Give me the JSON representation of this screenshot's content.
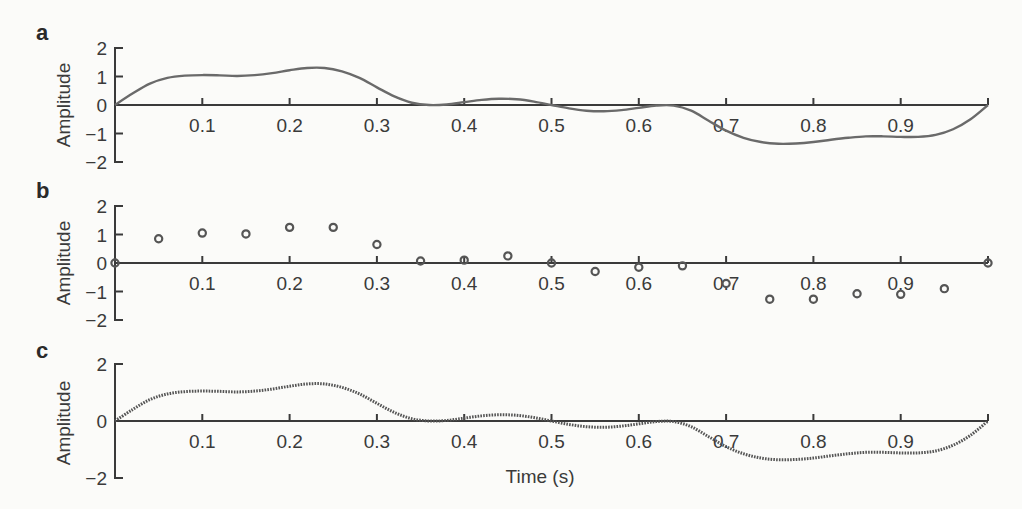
{
  "chart_data": [
    {
      "panel": "a",
      "type": "line",
      "title": "",
      "xlabel": "",
      "ylabel": "Amplitude",
      "xlim": [
        0,
        1.0
      ],
      "ylim": [
        -2,
        2
      ],
      "xticks": [
        "0.1",
        "0.2",
        "0.3",
        "0.4",
        "0.5",
        "0.6",
        "0.7",
        "0.8",
        "0.9"
      ],
      "yticks": [
        "2",
        "1",
        "0",
        "−1",
        "−2"
      ],
      "x": [
        0,
        0.02,
        0.04,
        0.06,
        0.08,
        0.1,
        0.12,
        0.14,
        0.16,
        0.18,
        0.2,
        0.22,
        0.24,
        0.26,
        0.28,
        0.3,
        0.32,
        0.34,
        0.36,
        0.38,
        0.4,
        0.42,
        0.44,
        0.46,
        0.48,
        0.5,
        0.52,
        0.54,
        0.56,
        0.58,
        0.6,
        0.62,
        0.64,
        0.66,
        0.68,
        0.7,
        0.72,
        0.74,
        0.76,
        0.78,
        0.8,
        0.82,
        0.84,
        0.86,
        0.88,
        0.9,
        0.92,
        0.94,
        0.96,
        0.98,
        1.0
      ],
      "y": [
        0,
        0.4,
        0.75,
        0.95,
        1.03,
        1.05,
        1.04,
        1.02,
        1.05,
        1.12,
        1.22,
        1.3,
        1.3,
        1.18,
        0.95,
        0.62,
        0.3,
        0.08,
        0.0,
        0.02,
        0.1,
        0.18,
        0.22,
        0.2,
        0.12,
        0.0,
        -0.12,
        -0.2,
        -0.22,
        -0.18,
        -0.1,
        -0.02,
        -0.02,
        -0.2,
        -0.55,
        -0.9,
        -1.15,
        -1.3,
        -1.36,
        -1.35,
        -1.3,
        -1.22,
        -1.15,
        -1.1,
        -1.1,
        -1.12,
        -1.12,
        -1.05,
        -0.85,
        -0.5,
        0
      ]
    },
    {
      "panel": "b",
      "type": "scatter",
      "title": "",
      "xlabel": "",
      "ylabel": "Amplitude",
      "xlim": [
        0,
        1.0
      ],
      "ylim": [
        -2,
        2
      ],
      "xticks": [
        "0.1",
        "0.2",
        "0.3",
        "0.4",
        "0.5",
        "0.6",
        "0.7",
        "0.8",
        "0.9"
      ],
      "yticks": [
        "2",
        "1",
        "0",
        "−1",
        "−2"
      ],
      "x": [
        0,
        0.05,
        0.1,
        0.15,
        0.2,
        0.25,
        0.3,
        0.35,
        0.4,
        0.45,
        0.5,
        0.55,
        0.6,
        0.65,
        0.7,
        0.75,
        0.8,
        0.85,
        0.9,
        0.95,
        1.0
      ],
      "y": [
        0,
        0.85,
        1.05,
        1.02,
        1.25,
        1.25,
        0.65,
        0.07,
        0.1,
        0.25,
        0.0,
        -0.3,
        -0.15,
        -0.1,
        -0.72,
        -1.27,
        -1.27,
        -1.08,
        -1.1,
        -0.9,
        0
      ]
    },
    {
      "panel": "c",
      "type": "line",
      "title": "",
      "xlabel": "Time (s)",
      "ylabel": "Amplitude",
      "xlim": [
        0,
        1.0
      ],
      "ylim": [
        -2,
        2
      ],
      "xticks": [
        "0.1",
        "0.2",
        "0.3",
        "0.4",
        "0.5",
        "0.6",
        "0.7",
        "0.8",
        "0.9"
      ],
      "yticks": [
        "2",
        "0",
        "−2"
      ],
      "x": [
        0,
        0.02,
        0.04,
        0.06,
        0.08,
        0.1,
        0.12,
        0.14,
        0.16,
        0.18,
        0.2,
        0.22,
        0.24,
        0.26,
        0.28,
        0.3,
        0.32,
        0.34,
        0.36,
        0.38,
        0.4,
        0.42,
        0.44,
        0.46,
        0.48,
        0.5,
        0.52,
        0.54,
        0.56,
        0.58,
        0.6,
        0.62,
        0.64,
        0.66,
        0.68,
        0.7,
        0.72,
        0.74,
        0.76,
        0.78,
        0.8,
        0.82,
        0.84,
        0.86,
        0.88,
        0.9,
        0.92,
        0.94,
        0.96,
        0.98,
        1.0
      ],
      "y": [
        0,
        0.4,
        0.75,
        0.95,
        1.03,
        1.05,
        1.04,
        1.02,
        1.05,
        1.12,
        1.22,
        1.3,
        1.3,
        1.18,
        0.95,
        0.62,
        0.3,
        0.08,
        0.0,
        0.02,
        0.1,
        0.18,
        0.22,
        0.2,
        0.12,
        0.0,
        -0.12,
        -0.2,
        -0.22,
        -0.18,
        -0.1,
        -0.02,
        -0.02,
        -0.2,
        -0.55,
        -0.9,
        -1.15,
        -1.3,
        -1.36,
        -1.35,
        -1.3,
        -1.22,
        -1.15,
        -1.1,
        -1.1,
        -1.12,
        -1.12,
        -1.05,
        -0.85,
        -0.5,
        0
      ]
    }
  ],
  "panels": [
    {
      "letter": "a",
      "ylabel": "Amplitude"
    },
    {
      "letter": "b",
      "ylabel": "Amplitude"
    },
    {
      "letter": "c",
      "ylabel": "Amplitude",
      "xlabel": "Time (s)"
    }
  ]
}
